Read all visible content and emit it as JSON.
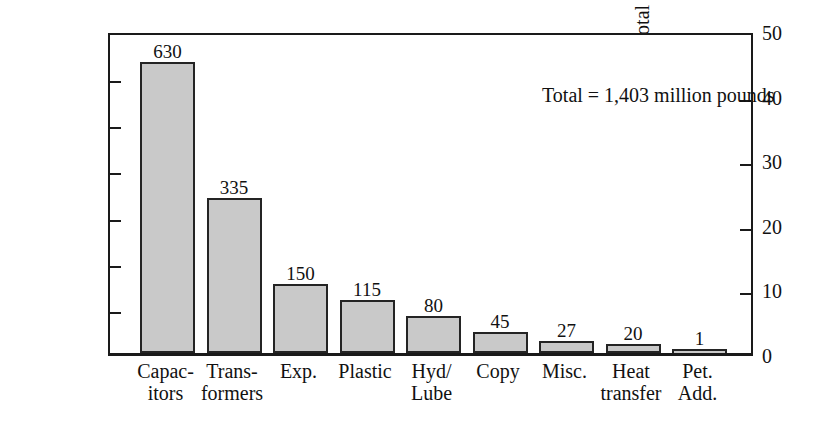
{
  "chart_data": {
    "type": "bar",
    "title": "",
    "subtitle": "",
    "xlabel": "",
    "ylabel": "Millions of lbs.",
    "ylabel_secondary": "% total",
    "ylim": [
      0,
      700
    ],
    "ylim_secondary": [
      0,
      50
    ],
    "yticks": [
      0,
      100,
      200,
      300,
      400,
      500,
      600,
      700
    ],
    "yticks_secondary": [
      0,
      10,
      20,
      30,
      40,
      50
    ],
    "grid": false,
    "legend": "none",
    "annotation": "Total = 1,403 million pounds",
    "total": 1403,
    "units": "million pounds",
    "bar_fill_color": "#c9c9c9",
    "bar_edge_color": "#242424",
    "axis_color": "#1a1a1a",
    "categories": [
      "Capac-\nitors",
      "Trans-\nformers",
      "Exp.",
      "Plastic",
      "Hyd/\nLube",
      "Copy",
      "Misc.",
      "Heat\ntransfer",
      "Pet.\nAdd."
    ],
    "values": [
      630,
      335,
      150,
      115,
      80,
      45,
      27,
      20,
      1
    ],
    "value_labels": [
      "630",
      "335",
      "150",
      "115",
      "80",
      "45",
      "27",
      "20",
      "1"
    ],
    "ytick_labels": [
      "0",
      "100",
      "200",
      "300",
      "400",
      "500",
      "600",
      "700"
    ],
    "ytick_labels_secondary": [
      "0",
      "10",
      "20",
      "30",
      "40",
      "50"
    ]
  }
}
